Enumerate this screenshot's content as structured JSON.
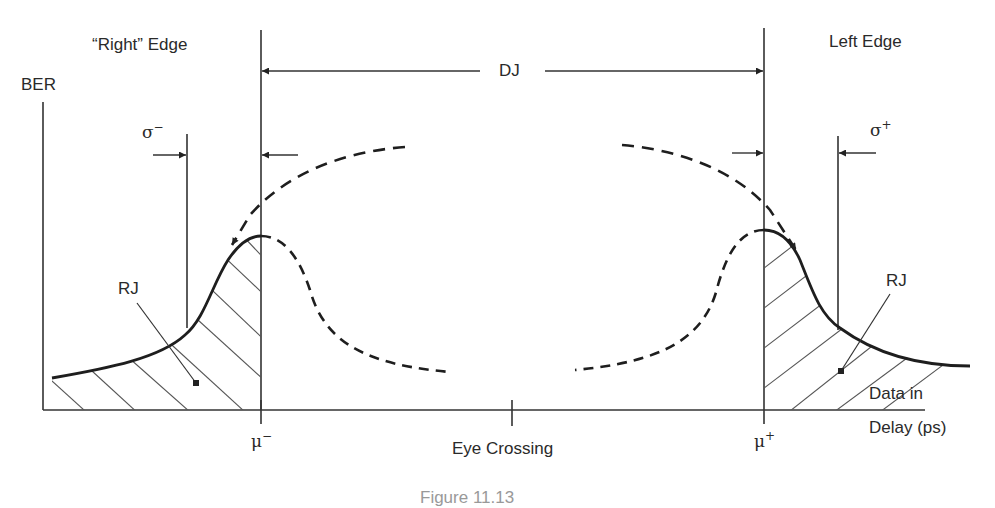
{
  "diagram": {
    "type": "jitter-bathtub-diagram",
    "labels": {
      "right_edge": "“Right” Edge",
      "left_edge": "Left Edge",
      "ber": "BER",
      "dj": "DJ",
      "sigma_minus": "σ",
      "sigma_minus_sup": "−",
      "sigma_plus": "σ",
      "sigma_plus_sup": "+",
      "rj_left": "RJ",
      "rj_right": "RJ",
      "mu_minus": "μ",
      "mu_minus_sup": "−",
      "mu_plus": "μ",
      "mu_plus_sup": "+",
      "eye_crossing": "Eye Crossing",
      "x_axis_line1": "Data in",
      "x_axis_line2": "Delay (ps)",
      "caption": "Figure 11.13"
    },
    "colors": {
      "line": "#333333",
      "curve": "#1e1e1e",
      "hatch": "#555555",
      "background": "#ffffff"
    }
  }
}
